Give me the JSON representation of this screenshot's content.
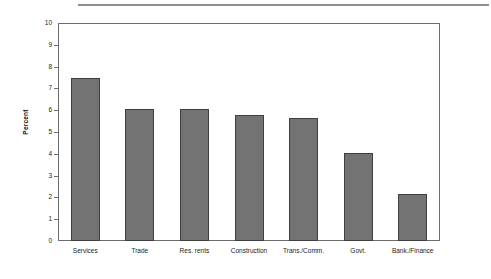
{
  "chart_data": {
    "type": "bar",
    "title": "",
    "subtitle": "",
    "xlabel": "",
    "ylabel": "Percent",
    "ylim": [
      0,
      10
    ],
    "yticks": [
      "0",
      "1",
      "2",
      "3",
      "4",
      "5",
      "6",
      "7",
      "8",
      "9",
      "10"
    ],
    "grid": false,
    "legend": "none",
    "orientation": "vertical",
    "bar_color": "#737373",
    "bar_edge_color": "#3f3f3f",
    "categories": [
      "Services",
      "Trade",
      "Res. rents",
      "Construction",
      "Trans./Comm.",
      "Govt.",
      "Bank./Finance"
    ],
    "values": [
      7.5,
      6.05,
      6.05,
      5.8,
      5.65,
      4.05,
      2.15
    ]
  }
}
